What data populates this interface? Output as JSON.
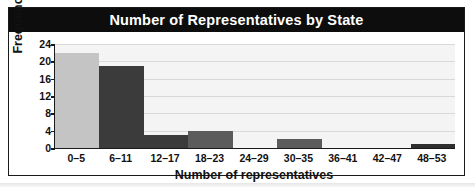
{
  "chart_data": {
    "type": "bar",
    "title": "Number of Representatives by State",
    "xlabel": "Number of representatives",
    "ylabel": "Frequency",
    "categories": [
      "0–5",
      "6–11",
      "12–17",
      "18–23",
      "24–29",
      "30–35",
      "36–41",
      "42–47",
      "48–53"
    ],
    "values": [
      22,
      19,
      3,
      4,
      0,
      2,
      0,
      0,
      1
    ],
    "bar_colors": [
      "#c4c4c4",
      "#3b3b3b",
      "#3b3b3b",
      "#5b5b5b",
      "#5b5b5b",
      "#5b5b5b",
      "#5b5b5b",
      "#5b5b5b",
      "#2f2f2f"
    ],
    "yticks": [
      0,
      4,
      8,
      12,
      16,
      20,
      24
    ],
    "ylim": [
      0,
      24
    ],
    "grid": true,
    "legend": "none",
    "plot_background": "#f4f4f4",
    "gridline_color": "#d9d9d9",
    "title_band_color": "#0d0d0d",
    "title_text_color": "#ffffff",
    "axis_color": "#1a1a1a"
  }
}
